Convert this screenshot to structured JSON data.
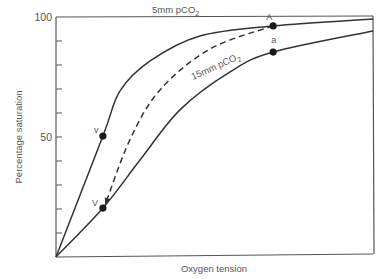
{
  "chart_data": {
    "type": "line",
    "title": "",
    "xlabel": "Oxygen tension",
    "ylabel": "Percentage saturation",
    "xlim": [
      0,
      1
    ],
    "ylim": [
      0,
      100
    ],
    "y_ticks_labeled": [
      {
        "value": 50,
        "label": "50"
      },
      {
        "value": 100,
        "label": "100"
      }
    ],
    "y_minor_ticks": [
      10,
      20,
      30,
      40,
      60,
      70,
      80,
      90
    ],
    "x_ticks": [],
    "grid": false,
    "legend": "none",
    "series": [
      {
        "name": "5mm pCO2",
        "label_main": "5mm pCO",
        "label_sub": "2",
        "style": "solid",
        "x": [
          0,
          0.148,
          0.202,
          0.297,
          0.454,
          0.685,
          1.0
        ],
        "y": [
          0,
          50.4,
          69.2,
          81.7,
          92.1,
          96.3,
          99.2
        ]
      },
      {
        "name": "15mm pCO2",
        "label_main": "15mm pCO",
        "label_sub": "2",
        "style": "solid",
        "x": [
          0,
          0.148,
          0.265,
          0.391,
          0.549,
          0.685,
          1.0
        ],
        "y": [
          0,
          20.4,
          40.4,
          61.3,
          77.1,
          85.4,
          94.2
        ]
      },
      {
        "name": "transition A to V",
        "style": "dashed-arrow",
        "x": [
          0.685,
          0.486,
          0.328,
          0.233,
          0.155
        ],
        "y": [
          96.3,
          86.7,
          69.6,
          48.8,
          21.7
        ]
      }
    ],
    "points": [
      {
        "label": "v",
        "x": 0.148,
        "y": 50.4
      },
      {
        "label": "V",
        "x": 0.148,
        "y": 20.4
      },
      {
        "label": "A",
        "x": 0.685,
        "y": 96.3
      },
      {
        "label": "a",
        "x": 0.685,
        "y": 85.4
      }
    ]
  }
}
